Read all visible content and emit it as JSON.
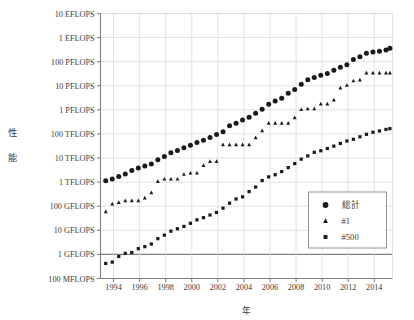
{
  "chart_data": {
    "type": "scatter",
    "title": "",
    "xlabel": "年",
    "ylabel": "性能",
    "ylabel_chars": [
      "性",
      "能"
    ],
    "scale": "log-y",
    "grid": true,
    "legend_position": "bottom-right",
    "xlim": [
      1993.0,
      2015.4
    ],
    "ylim_exponent": [
      8,
      19
    ],
    "x_ticks": [
      1994,
      1996,
      1998,
      2000,
      2002,
      2004,
      2006,
      2008,
      2010,
      2012,
      2014
    ],
    "x_tick_labels": [
      "1994",
      "1996",
      "1998",
      "2000",
      "2002",
      "2004",
      "2006",
      "2008",
      "2010",
      "2012",
      "2014"
    ],
    "y_ticks_exponent": [
      19,
      18,
      17,
      16,
      15,
      14,
      13,
      12,
      11,
      10,
      9,
      8
    ],
    "y_tick_labels": [
      "10 EFLOPS",
      "1 EFLOPS",
      "100 PFLOPS",
      "10 PFLOPS",
      "1 PFLOPS",
      "100 TFLOPS",
      "10 TFLOPS",
      "1 TFLOPS",
      "100 GFLOPS",
      "10 GFLOPS",
      "1 GFLOPS",
      "100 MFLOPS"
    ],
    "emphasized_gridline_label": "1 GFLOPS",
    "series": [
      {
        "name": "総計",
        "marker": "circle",
        "color": "#1a1a1a",
        "points": [
          [
            1993.4,
            1130000000000.0
          ],
          [
            1993.9,
            1350000000000.0
          ],
          [
            1994.4,
            1730000000000.0
          ],
          [
            1994.9,
            2180000000000.0
          ],
          [
            1995.4,
            3030000000000.0
          ],
          [
            1995.9,
            3870000000000.0
          ],
          [
            1996.4,
            4650000000000.0
          ],
          [
            1996.9,
            5700000000000.0
          ],
          [
            1997.4,
            8400000000000.0
          ],
          [
            1997.9,
            11600000000000.0
          ],
          [
            1998.4,
            16400000000000.0
          ],
          [
            1998.9,
            20700000000000.0
          ],
          [
            1999.4,
            26800000000000.0
          ],
          [
            1999.9,
            34300000000000.0
          ],
          [
            2000.4,
            44300000000000.0
          ],
          [
            2000.9,
            55400000000000.0
          ],
          [
            2001.4,
            71100000000000.0
          ],
          [
            2001.9,
            94000000000000.0
          ],
          [
            2002.4,
            122000000000000.0
          ],
          [
            2002.9,
            218000000000000.0
          ],
          [
            2003.4,
            279000000000000.0
          ],
          [
            2003.9,
            376000000000000.0
          ],
          [
            2004.4,
            496000000000000.0
          ],
          [
            2004.9,
            724000000000000.0
          ],
          [
            2005.4,
            1070000000000000.0
          ],
          [
            2005.9,
            1690000000000000.0
          ],
          [
            2006.4,
            2330000000000000.0
          ],
          [
            2006.9,
            3070000000000000.0
          ],
          [
            2007.4,
            4920000000000000.0
          ],
          [
            2007.9,
            6970000000000000.0
          ],
          [
            2008.4,
            1.17e+16
          ],
          [
            2008.9,
            1.76e+16
          ],
          [
            2009.4,
            2.22e+16
          ],
          [
            2009.9,
            2.76e+16
          ],
          [
            2010.4,
            3.26e+16
          ],
          [
            2010.9,
            4.37e+16
          ],
          [
            2011.4,
            5.88e+16
          ],
          [
            2011.9,
            7.41e+16
          ],
          [
            2012.4,
            1.23e+17
          ],
          [
            2012.9,
            1.62e+17
          ],
          [
            2013.4,
            2.23e+17
          ],
          [
            2013.9,
            2.5e+17
          ],
          [
            2014.4,
            2.74e+17
          ],
          [
            2014.9,
            3.09e+17
          ],
          [
            2015.2,
            3.61e+17
          ]
        ]
      },
      {
        "name": "#1",
        "marker": "triangle",
        "color": "#1a1a1a",
        "points": [
          [
            1993.4,
            59200000000.0
          ],
          [
            1993.9,
            124000000000.0
          ],
          [
            1994.4,
            143000000000.0
          ],
          [
            1994.9,
            170000000000.0
          ],
          [
            1995.4,
            170000000000.0
          ],
          [
            1995.9,
            170000000000.0
          ],
          [
            1996.4,
            220000000000.0
          ],
          [
            1996.9,
            368000000000.0
          ],
          [
            1997.4,
            1070000000000.0
          ],
          [
            1997.9,
            1340000000000.0
          ],
          [
            1998.4,
            1340000000000.0
          ],
          [
            1998.9,
            1340000000000.0
          ],
          [
            1999.4,
            2120000000000.0
          ],
          [
            1999.9,
            2380000000000.0
          ],
          [
            2000.4,
            2380000000000.0
          ],
          [
            2000.9,
            4940000000000.0
          ],
          [
            2001.4,
            7230000000000.0
          ],
          [
            2001.9,
            7230000000000.0
          ],
          [
            2002.4,
            35900000000000.0
          ],
          [
            2002.9,
            35900000000000.0
          ],
          [
            2003.4,
            35900000000000.0
          ],
          [
            2003.9,
            35900000000000.0
          ],
          [
            2004.4,
            35900000000000.0
          ],
          [
            2004.9,
            70700000000000.0
          ],
          [
            2005.4,
            137000000000000.0
          ],
          [
            2005.9,
            281000000000000.0
          ],
          [
            2006.4,
            281000000000000.0
          ],
          [
            2006.9,
            281000000000000.0
          ],
          [
            2007.4,
            281000000000000.0
          ],
          [
            2007.9,
            478000000000000.0
          ],
          [
            2008.4,
            1030000000000000.0
          ],
          [
            2008.9,
            1110000000000000.0
          ],
          [
            2009.4,
            1110000000000000.0
          ],
          [
            2009.9,
            1760000000000000.0
          ],
          [
            2010.4,
            1760000000000000.0
          ],
          [
            2010.9,
            2570000000000000.0
          ],
          [
            2011.4,
            8160000000000000.0
          ],
          [
            2011.9,
            1.05e+16
          ],
          [
            2012.4,
            1.61e+16
          ],
          [
            2012.9,
            1.76e+16
          ],
          [
            2013.4,
            3.39e+16
          ],
          [
            2013.9,
            3.39e+16
          ],
          [
            2014.4,
            3.39e+16
          ],
          [
            2014.9,
            3.39e+16
          ],
          [
            2015.2,
            3.39e+16
          ]
        ]
      },
      {
        "name": "#500",
        "marker": "square",
        "color": "#1a1a1a",
        "points": [
          [
            1993.4,
            422000000.0
          ],
          [
            1993.9,
            480000000.0
          ],
          [
            1994.4,
            822000000.0
          ],
          [
            1994.9,
            1100000000.0
          ],
          [
            1995.4,
            1200000000.0
          ],
          [
            1995.9,
            1730000000.0
          ],
          [
            1996.4,
            2100000000.0
          ],
          [
            1996.9,
            2700000000.0
          ],
          [
            1997.4,
            4500000000.0
          ],
          [
            1997.9,
            6300000000.0
          ],
          [
            1998.4,
            9200000000.0
          ],
          [
            1998.9,
            11600000000.0
          ],
          [
            1999.4,
            14500000000.0
          ],
          [
            1999.9,
            19600000000.0
          ],
          [
            2000.4,
            27100000000.0
          ],
          [
            2000.9,
            33500000000.0
          ],
          [
            2001.4,
            43200000000.0
          ],
          [
            2001.9,
            55100000000.0
          ],
          [
            2002.4,
            83100000000.0
          ],
          [
            2002.9,
            134000000000.0
          ],
          [
            2003.4,
            200000000000.0
          ],
          [
            2003.9,
            245000000000.0
          ],
          [
            2004.4,
            406000000000.0
          ],
          [
            2004.9,
            624000000000.0
          ],
          [
            2005.4,
            1170000000000.0
          ],
          [
            2005.9,
            1650000000000.0
          ],
          [
            2006.4,
            2030000000000.0
          ],
          [
            2006.9,
            2740000000000.0
          ],
          [
            2007.4,
            4010000000000.0
          ],
          [
            2007.9,
            5900000000000.0
          ],
          [
            2008.4,
            9000000000000.0
          ],
          [
            2008.9,
            12300000000000.0
          ],
          [
            2009.4,
            17300000000000.0
          ],
          [
            2009.9,
            20100000000000.0
          ],
          [
            2010.4,
            24800000000000.0
          ],
          [
            2010.9,
            31200000000000.0
          ],
          [
            2011.4,
            40400000000000.0
          ],
          [
            2011.9,
            50900000000000.0
          ],
          [
            2012.4,
            60200000000000.0
          ],
          [
            2012.9,
            76300000000000.0
          ],
          [
            2013.4,
            96600000000000.0
          ],
          [
            2013.9,
            118000000000000.0
          ],
          [
            2014.4,
            133000000000000.0
          ],
          [
            2014.9,
            154000000000000.0
          ],
          [
            2015.2,
            166000000000000.0
          ]
        ]
      }
    ],
    "legend": {
      "entries": [
        {
          "label": "総計",
          "marker": "circle"
        },
        {
          "label": "#1",
          "marker": "triangle"
        },
        {
          "label": "#500",
          "marker": "square"
        }
      ]
    }
  }
}
